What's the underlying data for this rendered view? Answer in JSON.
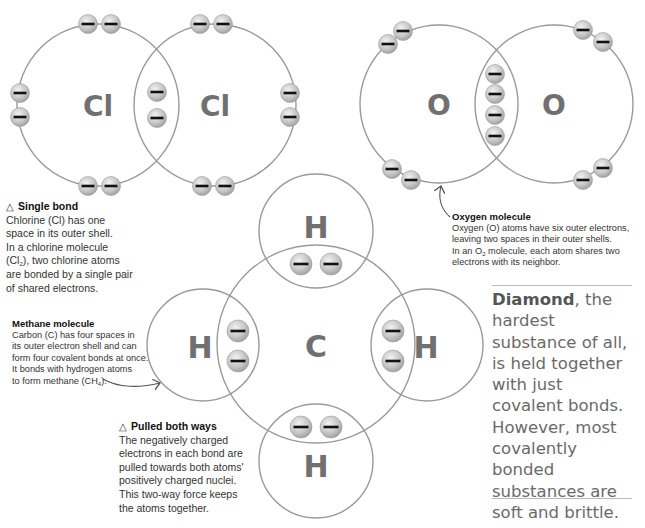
{
  "colors": {
    "shell_stroke": "#9a9a9a",
    "atom_label": "#707070",
    "electron_fill": "#c8c8c8",
    "electron_minus": "#111111",
    "body_text": "#333333",
    "diamond_text": "#6a6a6a",
    "rule": "#bbbbbb"
  },
  "chlorine": {
    "atoms": [
      {
        "label": "Cl",
        "cx": 98,
        "cy": 105,
        "r": 81
      },
      {
        "label": "Cl",
        "cx": 215,
        "cy": 105,
        "r": 81
      }
    ],
    "electrons": [
      [
        88,
        24
      ],
      [
        111,
        24
      ],
      [
        200,
        24
      ],
      [
        223,
        24
      ],
      [
        20,
        93
      ],
      [
        20,
        117
      ],
      [
        290,
        93
      ],
      [
        290,
        117
      ],
      [
        88,
        186
      ],
      [
        111,
        186
      ],
      [
        202,
        186
      ],
      [
        225,
        186
      ],
      [
        157,
        92
      ],
      [
        157,
        118
      ]
    ],
    "caption": {
      "icon": "triangle-icon",
      "title": "Single bond",
      "lines": [
        "Chlorine (Cl) has one",
        "space in its outer shell.",
        "In a chlorine molecule",
        "(Cl",
        "2",
        "), two chlorine atoms",
        "are bonded by a single pair",
        "of shared electrons."
      ]
    }
  },
  "oxygen": {
    "atoms": [
      {
        "label": "O",
        "cx": 439,
        "cy": 104,
        "r": 79
      },
      {
        "label": "O",
        "cx": 554,
        "cy": 104,
        "r": 79
      }
    ],
    "electrons": [
      [
        403,
        31
      ],
      [
        388,
        44
      ],
      [
        392,
        169
      ],
      [
        411,
        180
      ],
      [
        583,
        30
      ],
      [
        603,
        42
      ],
      [
        603,
        168
      ],
      [
        583,
        180
      ],
      [
        495,
        74
      ],
      [
        495,
        94
      ],
      [
        495,
        115
      ],
      [
        495,
        136
      ]
    ],
    "caption": {
      "title": "Oxygen molecule",
      "lines": [
        "Oxygen (O) atoms have six outer electrons,",
        "leaving two spaces in their outer shells.",
        "In an O",
        "2",
        " molecule, each atom shares two",
        "electrons with its neighbor."
      ]
    }
  },
  "methane": {
    "carbon": {
      "label": "C",
      "cx": 316,
      "cy": 344,
      "r": 99
    },
    "hydrogens": [
      {
        "label": "H",
        "cx": 316,
        "cy": 231,
        "r": 57,
        "label_x": 316,
        "label_y": 227
      },
      {
        "label": "H",
        "cx": 203,
        "cy": 345,
        "r": 56,
        "label_x": 200,
        "label_y": 347
      },
      {
        "label": "H",
        "cx": 427,
        "cy": 345,
        "r": 56,
        "label_x": 426,
        "label_y": 347
      },
      {
        "label": "H",
        "cx": 316,
        "cy": 461,
        "r": 57,
        "label_x": 316,
        "label_y": 466
      }
    ],
    "electrons": [
      [
        301,
        264
      ],
      [
        331,
        264
      ],
      [
        238,
        331
      ],
      [
        238,
        361
      ],
      [
        393,
        331
      ],
      [
        393,
        361
      ],
      [
        301,
        427
      ],
      [
        331,
        427
      ]
    ],
    "caption": {
      "title": "Methane molecule",
      "lines": [
        "Carbon (C) has four spaces in",
        "its outer electron shell and can",
        "form four covalent bonds at once.",
        "It bonds with hydrogen atoms",
        "to form methane (CH",
        "4",
        ")."
      ]
    }
  },
  "pulled": {
    "icon": "triangle-icon",
    "title": "Pulled both ways",
    "lines": [
      "The negatively charged",
      "electrons in each bond are",
      "pulled towards both atoms'",
      "positively charged nuclei.",
      "This two-way force keeps",
      "the atoms together."
    ]
  },
  "diamond": {
    "bold": "Diamond",
    "text": ", the hardest substance of all, is held together with just covalent bonds. However, most covalently bonded substances are soft and brittle."
  },
  "icons": {
    "triangle": "△",
    "minus": "−"
  }
}
